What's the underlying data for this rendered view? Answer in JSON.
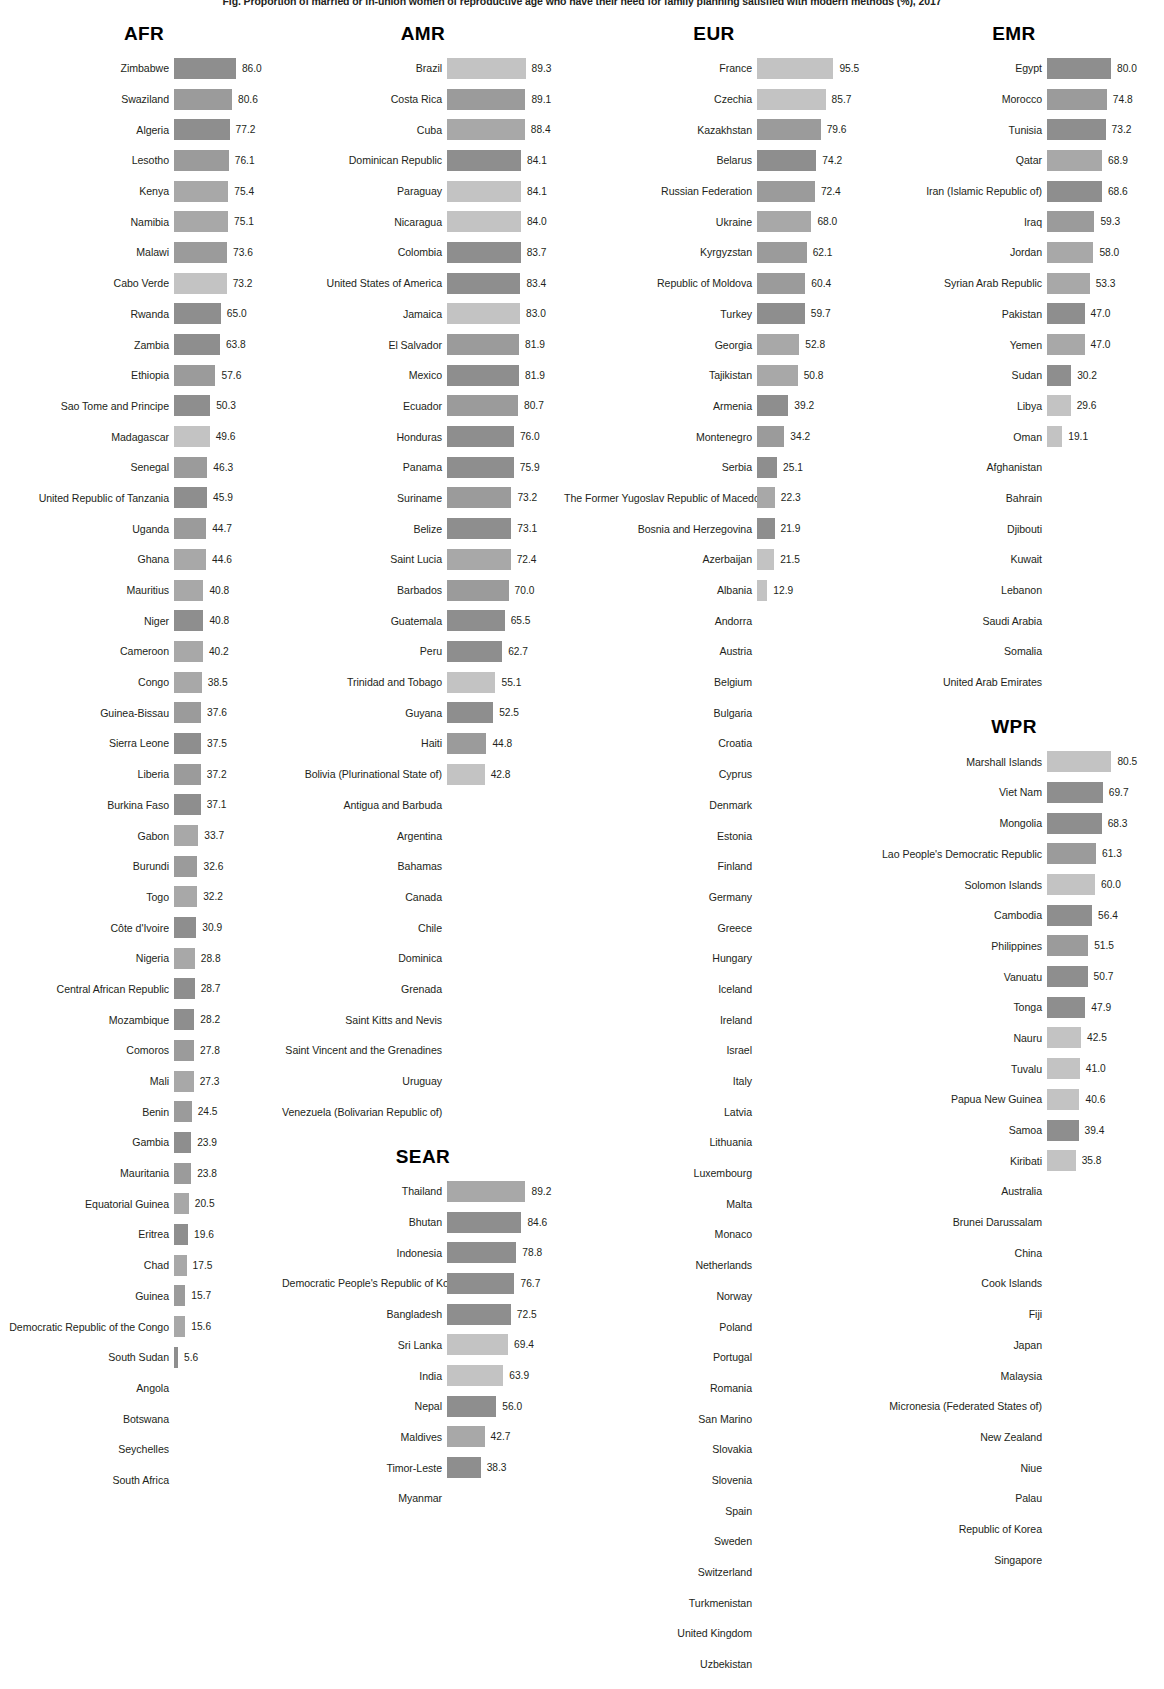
{
  "title": "Fig. Proportion of married or in-union women of reproductive age who have their need for family planning satisfied with modern methods (%), 2017",
  "chart_data": {
    "type": "bar",
    "title": "Proportion of married or in-union women of reproductive age who have their need for family planning satisfied with modern methods (%)",
    "xlabel": "",
    "ylabel": "Country",
    "value_suffix": "%",
    "xlim": [
      0,
      100
    ],
    "grid": false,
    "legend": "none",
    "orientation": "horizontal",
    "groups": [
      {
        "name": "AFR",
        "column": 1,
        "categories": [
          "Zimbabwe",
          "Swaziland",
          "Algeria",
          "Lesotho",
          "Kenya",
          "Namibia",
          "Malawi",
          "Cabo Verde",
          "Rwanda",
          "Zambia",
          "Ethiopia",
          "Sao Tome and Principe",
          "Madagascar",
          "Senegal",
          "United Republic of Tanzania",
          "Uganda",
          "Ghana",
          "Mauritius",
          "Niger",
          "Cameroon",
          "Congo",
          "Guinea-Bissau",
          "Sierra Leone",
          "Liberia",
          "Burkina Faso",
          "Gabon",
          "Burundi",
          "Togo",
          "Côte d'Ivoire",
          "Nigeria",
          "Central African Republic",
          "Mozambique",
          "Comoros",
          "Mali",
          "Benin",
          "Gambia",
          "Mauritania",
          "Equatorial Guinea",
          "Eritrea",
          "Chad",
          "Guinea",
          "Democratic Republic of the Congo",
          "South Sudan",
          "Angola",
          "Botswana",
          "Seychelles",
          "South Africa"
        ],
        "values": [
          86.0,
          80.6,
          77.2,
          76.1,
          75.4,
          75.1,
          73.6,
          73.2,
          65.0,
          63.8,
          57.6,
          50.3,
          49.6,
          46.3,
          45.9,
          44.7,
          44.6,
          40.8,
          40.8,
          40.2,
          38.5,
          37.6,
          37.5,
          37.2,
          37.1,
          33.7,
          32.6,
          32.2,
          30.9,
          28.8,
          28.7,
          28.2,
          27.8,
          27.3,
          24.5,
          23.9,
          23.8,
          20.5,
          19.6,
          17.5,
          15.7,
          15.6,
          5.6,
          null,
          null,
          null,
          null
        ],
        "shades": [
          "b",
          "a",
          "b",
          "a",
          "c",
          "c",
          "a",
          "d",
          "b",
          "b",
          "a",
          "b",
          "d",
          "a",
          "b",
          "a",
          "c",
          "c",
          "b",
          "c",
          "c",
          "a",
          "b",
          "a",
          "b",
          "c",
          "a",
          "c",
          "b",
          "c",
          "b",
          "b",
          "a",
          "c",
          "a",
          "b",
          "a",
          "c",
          "b",
          "c",
          "a",
          "c",
          "b",
          null,
          null,
          null,
          null
        ]
      },
      {
        "name": "AMR",
        "column": 2,
        "categories": [
          "Brazil",
          "Costa Rica",
          "Cuba",
          "Dominican Republic",
          "Paraguay",
          "Nicaragua",
          "Colombia",
          "United States of America",
          "Jamaica",
          "El Salvador",
          "Mexico",
          "Ecuador",
          "Honduras",
          "Panama",
          "Suriname",
          "Belize",
          "Saint Lucia",
          "Barbados",
          "Guatemala",
          "Peru",
          "Trinidad and Tobago",
          "Guyana",
          "Haiti",
          "Bolivia (Plurinational State of)",
          "Antigua and Barbuda",
          "Argentina",
          "Bahamas",
          "Canada",
          "Chile",
          "Dominica",
          "Grenada",
          "Saint Kitts and Nevis",
          "Saint Vincent and the Grenadines",
          "Uruguay",
          "Venezuela (Bolivarian Republic of)"
        ],
        "values": [
          89.3,
          89.1,
          88.4,
          84.1,
          84.1,
          84.0,
          83.7,
          83.4,
          83.0,
          81.9,
          81.9,
          80.7,
          76.0,
          75.9,
          73.2,
          73.1,
          72.4,
          70.0,
          65.5,
          62.7,
          55.1,
          52.5,
          44.8,
          42.8,
          null,
          null,
          null,
          null,
          null,
          null,
          null,
          null,
          null,
          null,
          null
        ],
        "shades": [
          "d",
          "a",
          "c",
          "b",
          "d",
          "d",
          "b",
          "b",
          "d",
          "a",
          "b",
          "a",
          "b",
          "b",
          "a",
          "b",
          "c",
          "a",
          "b",
          "b",
          "d",
          "b",
          "a",
          "d",
          null,
          null,
          null,
          null,
          null,
          null,
          null,
          null,
          null,
          null,
          null
        ]
      },
      {
        "name": "SEAR",
        "column": 2,
        "categories": [
          "Thailand",
          "Bhutan",
          "Indonesia",
          "Democratic People's Republic of Korea",
          "Bangladesh",
          "Sri Lanka",
          "India",
          "Nepal",
          "Maldives",
          "Timor-Leste",
          "Myanmar"
        ],
        "values": [
          89.2,
          84.6,
          78.8,
          76.7,
          72.5,
          69.4,
          63.9,
          56.0,
          42.7,
          38.3,
          null
        ],
        "shades": [
          "c",
          "b",
          "b",
          "b",
          "b",
          "d",
          "d",
          "b",
          "c",
          "b",
          null
        ]
      },
      {
        "name": "EUR",
        "column": 3,
        "categories": [
          "France",
          "Czechia",
          "Kazakhstan",
          "Belarus",
          "Russian Federation",
          "Ukraine",
          "Kyrgyzstan",
          "Republic of Moldova",
          "Turkey",
          "Georgia",
          "Tajikistan",
          "Armenia",
          "Montenegro",
          "Serbia",
          "The Former Yugoslav Republic of Macedonia",
          "Bosnia and Herzegovina",
          "Azerbaijan",
          "Albania",
          "Andorra",
          "Austria",
          "Belgium",
          "Bulgaria",
          "Croatia",
          "Cyprus",
          "Denmark",
          "Estonia",
          "Finland",
          "Germany",
          "Greece",
          "Hungary",
          "Iceland",
          "Ireland",
          "Israel",
          "Italy",
          "Latvia",
          "Lithuania",
          "Luxembourg",
          "Malta",
          "Monaco",
          "Netherlands",
          "Norway",
          "Poland",
          "Portugal",
          "Romania",
          "San Marino",
          "Slovakia",
          "Slovenia",
          "Spain",
          "Sweden",
          "Switzerland",
          "Turkmenistan",
          "United Kingdom",
          "Uzbekistan"
        ],
        "values": [
          95.5,
          85.7,
          79.6,
          74.2,
          72.4,
          68.0,
          62.1,
          60.4,
          59.7,
          52.8,
          50.8,
          39.2,
          34.2,
          25.1,
          22.3,
          21.9,
          21.5,
          12.9,
          null,
          null,
          null,
          null,
          null,
          null,
          null,
          null,
          null,
          null,
          null,
          null,
          null,
          null,
          null,
          null,
          null,
          null,
          null,
          null,
          null,
          null,
          null,
          null,
          null,
          null,
          null,
          null,
          null,
          null,
          null,
          null,
          null,
          null,
          null
        ],
        "shades": [
          "d",
          "d",
          "a",
          "b",
          "a",
          "c",
          "a",
          "a",
          "b",
          "c",
          "c",
          "b",
          "a",
          "b",
          "c",
          "b",
          "d",
          "d",
          null,
          null,
          null,
          null,
          null,
          null,
          null,
          null,
          null,
          null,
          null,
          null,
          null,
          null,
          null,
          null,
          null,
          null,
          null,
          null,
          null,
          null,
          null,
          null,
          null,
          null,
          null,
          null,
          null,
          null,
          null,
          null,
          null,
          null,
          null
        ]
      },
      {
        "name": "EMR",
        "column": 4,
        "categories": [
          "Egypt",
          "Morocco",
          "Tunisia",
          "Qatar",
          "Iran (Islamic Republic of)",
          "Iraq",
          "Jordan",
          "Syrian Arab Republic",
          "Pakistan",
          "Yemen",
          "Sudan",
          "Libya",
          "Oman",
          "Afghanistan",
          "Bahrain",
          "Djibouti",
          "Kuwait",
          "Lebanon",
          "Saudi Arabia",
          "Somalia",
          "United Arab Emirates"
        ],
        "values": [
          80.0,
          74.8,
          73.2,
          68.9,
          68.6,
          59.3,
          58.0,
          53.3,
          47.0,
          47.0,
          30.2,
          29.6,
          19.1,
          null,
          null,
          null,
          null,
          null,
          null,
          null,
          null
        ],
        "shades": [
          "b",
          "a",
          "b",
          "c",
          "b",
          "a",
          "c",
          "c",
          "b",
          "c",
          "b",
          "d",
          "d",
          null,
          null,
          null,
          null,
          null,
          null,
          null,
          null
        ]
      },
      {
        "name": "WPR",
        "column": 4,
        "categories": [
          "Marshall Islands",
          "Viet Nam",
          "Mongolia",
          "Lao People's Democratic Republic",
          "Solomon Islands",
          "Cambodia",
          "Philippines",
          "Vanuatu",
          "Tonga",
          "Nauru",
          "Tuvalu",
          "Papua New Guinea",
          "Samoa",
          "Kiribati",
          "Australia",
          "Brunei Darussalam",
          "China",
          "Cook Islands",
          "Fiji",
          "Japan",
          "Malaysia",
          "Micronesia (Federated States of)",
          "New Zealand",
          "Niue",
          "Palau",
          "Republic of Korea",
          "Singapore"
        ],
        "values": [
          80.5,
          69.7,
          68.3,
          61.3,
          60.0,
          56.4,
          51.5,
          50.7,
          47.9,
          42.5,
          41.0,
          40.6,
          39.4,
          35.8,
          null,
          null,
          null,
          null,
          null,
          null,
          null,
          null,
          null,
          null,
          null,
          null,
          null
        ],
        "shades": [
          "d",
          "b",
          "b",
          "a",
          "d",
          "b",
          "a",
          "b",
          "b",
          "d",
          "d",
          "d",
          "b",
          "d",
          null,
          null,
          null,
          null,
          null,
          null,
          null,
          null,
          null,
          null,
          null,
          null,
          null
        ]
      }
    ]
  }
}
